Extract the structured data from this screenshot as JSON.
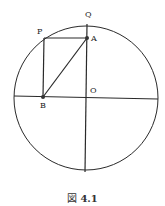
{
  "figure": {
    "caption_prefix": "図",
    "caption_number": "4.1",
    "points": {
      "Q": {
        "label": "Q",
        "x": 87,
        "y": 24
      },
      "P": {
        "label": "P",
        "x": 44,
        "y": 38
      },
      "A": {
        "label": "A",
        "x": 87,
        "y": 38
      },
      "O": {
        "label": "O",
        "x": 86,
        "y": 97
      },
      "B": {
        "label": "B",
        "x": 43,
        "y": 97
      }
    },
    "circle": {
      "cx": 86,
      "cy": 98,
      "r": 72
    },
    "colors": {
      "stroke": "#2a2a2a",
      "point": "#333333",
      "text": "#222222"
    }
  }
}
